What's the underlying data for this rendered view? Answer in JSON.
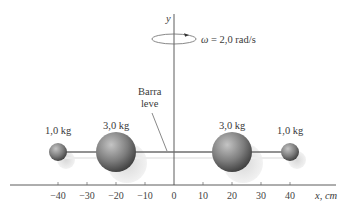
{
  "figure": {
    "axes": {
      "y_label": "y",
      "x_label": "x, cm",
      "x_ticks": [
        "−40",
        "−30",
        "−20",
        "−10",
        "0",
        "10",
        "20",
        "30",
        "40"
      ]
    },
    "rotation": {
      "omega_symbol": "ω",
      "omega_text": " = 2,0 rad/s"
    },
    "rod": {
      "label_line1": "Barra",
      "label_line2": "leve"
    },
    "masses": [
      {
        "label": "1,0 kg",
        "x_cm": -40
      },
      {
        "label": "3,0 kg",
        "x_cm": -20
      },
      {
        "label": "3,0 kg",
        "x_cm": 20
      },
      {
        "label": "1,0 kg",
        "x_cm": 40
      }
    ],
    "colors": {
      "sphere_dark": "#3f3f3f",
      "sphere_light": "#b9b9b9",
      "rod": "#6e6e6e",
      "axis": "#4a4a4a",
      "shadow": "#e3e3e3"
    }
  }
}
